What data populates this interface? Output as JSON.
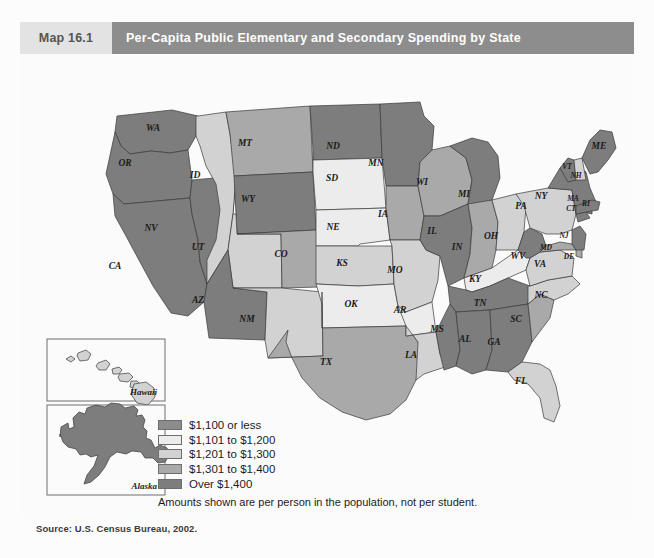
{
  "header": {
    "map_number": "Map 16.1",
    "title": "Per-Capita Public Elementary and Secondary Spending by State"
  },
  "legend": {
    "items": [
      {
        "label": "$1,100 or less",
        "color": "#8c8c8c"
      },
      {
        "label": "$1,101 to $1,200",
        "color": "#ececec"
      },
      {
        "label": "$1,201 to $1,300",
        "color": "#d2d2d2"
      },
      {
        "label": "$1,301 to $1,400",
        "color": "#a9a9a9"
      },
      {
        "label": "Over $1,400",
        "color": "#7d7d7d"
      }
    ],
    "note": "Amounts shown are per person in the population, not per student."
  },
  "source": "Source: U.S. Census Bureau, 2002.",
  "insets": {
    "hawaii_label": "Hawaii",
    "alaska_label": "Alaska"
  },
  "chart_data": {
    "type": "map",
    "title": "Per-Capita Public Elementary and Secondary Spending by State",
    "note": "Amounts shown are per person in the population, not per student.",
    "source": "Source: U.S. Census Bureau, 2002.",
    "bins": [
      {
        "label": "$1,100 or less",
        "color": "#8c8c8c",
        "index": 0
      },
      {
        "label": "$1,101 to $1,200",
        "color": "#ececec",
        "index": 1
      },
      {
        "label": "$1,201 to $1,300",
        "color": "#d2d2d2",
        "index": 2
      },
      {
        "label": "$1,301 to $1,400",
        "color": "#a9a9a9",
        "index": 3
      },
      {
        "label": "Over $1,400",
        "color": "#7d7d7d",
        "index": 4
      }
    ],
    "states": [
      {
        "code": "WA",
        "bin": 4
      },
      {
        "code": "OR",
        "bin": 4
      },
      {
        "code": "CA",
        "bin": 4
      },
      {
        "code": "NV",
        "bin": 4
      },
      {
        "code": "ID",
        "bin": 2
      },
      {
        "code": "MT",
        "bin": 3
      },
      {
        "code": "WY",
        "bin": 4
      },
      {
        "code": "UT",
        "bin": 2
      },
      {
        "code": "AZ",
        "bin": 4
      },
      {
        "code": "NM",
        "bin": 2
      },
      {
        "code": "CO",
        "bin": 3
      },
      {
        "code": "ND",
        "bin": 4
      },
      {
        "code": "SD",
        "bin": 1
      },
      {
        "code": "NE",
        "bin": 1
      },
      {
        "code": "KS",
        "bin": 2
      },
      {
        "code": "OK",
        "bin": 1
      },
      {
        "code": "TX",
        "bin": 3
      },
      {
        "code": "MN",
        "bin": 4
      },
      {
        "code": "IA",
        "bin": 3
      },
      {
        "code": "MO",
        "bin": 2
      },
      {
        "code": "AR",
        "bin": 1
      },
      {
        "code": "LA",
        "bin": 2
      },
      {
        "code": "WI",
        "bin": 3
      },
      {
        "code": "IL",
        "bin": 4
      },
      {
        "code": "MI",
        "bin": 4
      },
      {
        "code": "IN",
        "bin": 3
      },
      {
        "code": "OH",
        "bin": 2
      },
      {
        "code": "KY",
        "bin": 1
      },
      {
        "code": "TN",
        "bin": 4
      },
      {
        "code": "MS",
        "bin": 4
      },
      {
        "code": "AL",
        "bin": 4
      },
      {
        "code": "GA",
        "bin": 4
      },
      {
        "code": "FL",
        "bin": 2
      },
      {
        "code": "SC",
        "bin": 3
      },
      {
        "code": "NC",
        "bin": 2
      },
      {
        "code": "VA",
        "bin": 2
      },
      {
        "code": "WV",
        "bin": 4
      },
      {
        "code": "MD",
        "bin": 3
      },
      {
        "code": "DE",
        "bin": 3
      },
      {
        "code": "PA",
        "bin": 2
      },
      {
        "code": "NJ",
        "bin": 4
      },
      {
        "code": "NY",
        "bin": 4
      },
      {
        "code": "CT",
        "bin": 4
      },
      {
        "code": "RI",
        "bin": 4
      },
      {
        "code": "MA",
        "bin": 4
      },
      {
        "code": "VT",
        "bin": 4
      },
      {
        "code": "NH",
        "bin": 2
      },
      {
        "code": "ME",
        "bin": 4
      },
      {
        "code": "AK",
        "bin": 4
      },
      {
        "code": "HI",
        "bin": 3
      }
    ]
  },
  "state_labels": [
    {
      "code": "WA",
      "x": 133,
      "y": 77
    },
    {
      "code": "OR",
      "x": 105,
      "y": 112
    },
    {
      "code": "CA",
      "x": 95,
      "y": 215
    },
    {
      "code": "NV",
      "x": 131,
      "y": 177
    },
    {
      "code": "ID",
      "x": 175,
      "y": 124
    },
    {
      "code": "MT",
      "x": 225,
      "y": 92
    },
    {
      "code": "WY",
      "x": 228,
      "y": 148
    },
    {
      "code": "UT",
      "x": 178,
      "y": 196
    },
    {
      "code": "AZ",
      "x": 178,
      "y": 249
    },
    {
      "code": "NM",
      "x": 227,
      "y": 268
    },
    {
      "code": "CO",
      "x": 261,
      "y": 203
    },
    {
      "code": "ND",
      "x": 313,
      "y": 95
    },
    {
      "code": "SD",
      "x": 312,
      "y": 127
    },
    {
      "code": "NE",
      "x": 313,
      "y": 176
    },
    {
      "code": "KS",
      "x": 322,
      "y": 212
    },
    {
      "code": "OK",
      "x": 331,
      "y": 253
    },
    {
      "code": "TX",
      "x": 306,
      "y": 311
    },
    {
      "code": "MN",
      "x": 356,
      "y": 112
    },
    {
      "code": "IA",
      "x": 363,
      "y": 163
    },
    {
      "code": "MO",
      "x": 375,
      "y": 219
    },
    {
      "code": "AR",
      "x": 380,
      "y": 259
    },
    {
      "code": "LA",
      "x": 391,
      "y": 304
    },
    {
      "code": "WI",
      "x": 402,
      "y": 131
    },
    {
      "code": "IL",
      "x": 412,
      "y": 180
    },
    {
      "code": "MI",
      "x": 444,
      "y": 143
    },
    {
      "code": "IN",
      "x": 437,
      "y": 196
    },
    {
      "code": "OH",
      "x": 471,
      "y": 185
    },
    {
      "code": "KY",
      "x": 455,
      "y": 228
    },
    {
      "code": "TN",
      "x": 460,
      "y": 252
    },
    {
      "code": "MS",
      "x": 417,
      "y": 278
    },
    {
      "code": "AL",
      "x": 445,
      "y": 288
    },
    {
      "code": "GA",
      "x": 474,
      "y": 291
    },
    {
      "code": "FL",
      "x": 501,
      "y": 330
    },
    {
      "code": "SC",
      "x": 496,
      "y": 268
    },
    {
      "code": "NC",
      "x": 521,
      "y": 244
    },
    {
      "code": "VA",
      "x": 520,
      "y": 213
    },
    {
      "code": "WV",
      "x": 498,
      "y": 205
    },
    {
      "code": "MD",
      "x": 526,
      "y": 196
    },
    {
      "code": "DE",
      "x": 549,
      "y": 205
    },
    {
      "code": "PA",
      "x": 501,
      "y": 155
    },
    {
      "code": "NJ",
      "x": 544,
      "y": 184
    },
    {
      "code": "NY",
      "x": 521,
      "y": 145
    },
    {
      "code": "CT",
      "x": 551,
      "y": 157
    },
    {
      "code": "RI",
      "x": 566,
      "y": 152
    },
    {
      "code": "MA",
      "x": 553,
      "y": 147
    },
    {
      "code": "VT",
      "x": 547,
      "y": 115
    },
    {
      "code": "NH",
      "x": 556,
      "y": 124
    },
    {
      "code": "ME",
      "x": 579,
      "y": 95
    }
  ]
}
